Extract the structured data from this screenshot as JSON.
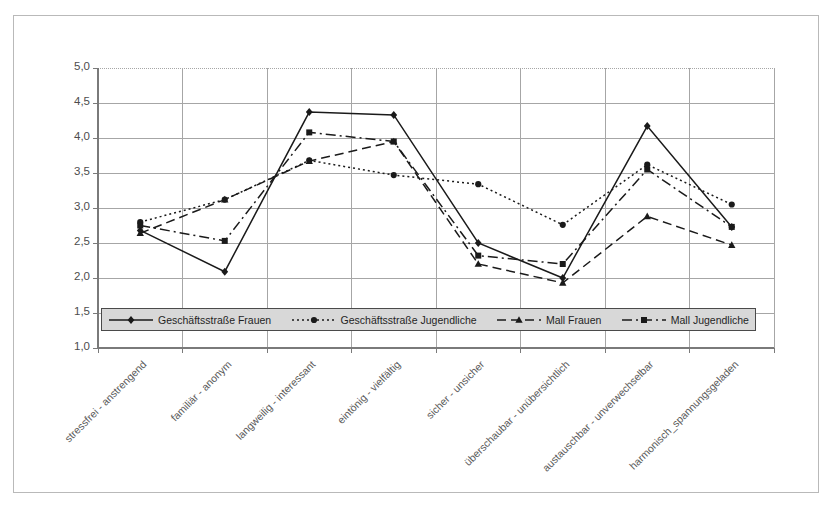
{
  "chart_data": {
    "type": "line",
    "title": "",
    "subtitle": "",
    "xlabel": "",
    "ylabel": "",
    "ylim": [
      1.0,
      5.0
    ],
    "y_tick_step": 0.5,
    "grid": true,
    "grid_axis": "y",
    "legend_position": "inside-bottom-left",
    "decimal_separator": ",",
    "y_tick_labels": [
      "1,0",
      "1,5",
      "2,0",
      "2,5",
      "3,0",
      "3,5",
      "4,0",
      "4,5",
      "5,0"
    ],
    "y_tick_values": [
      1.0,
      1.5,
      2.0,
      2.5,
      3.0,
      3.5,
      4.0,
      4.5,
      5.0
    ],
    "categories": [
      "stressfrei - anstrengend",
      "familiär - anonym",
      "langweilig - interessant",
      "eintönig - vielfältig",
      "sicher - unsicher",
      "überschaubar - unübersichtlich",
      "austauschbar - unverwechselbar",
      "harmonisch_spannungsgeladen"
    ],
    "series": [
      {
        "name": "Geschäftsstraße Frauen",
        "marker": "diamond",
        "line_style": "solid",
        "color": "#1a1a1a",
        "values": [
          2.68,
          2.09,
          4.37,
          4.33,
          2.5,
          2.0,
          4.17,
          2.73
        ]
      },
      {
        "name": "Geschäftsstraße Jugendliche",
        "marker": "circle",
        "line_style": "dotted",
        "color": "#1a1a1a",
        "values": [
          2.8,
          3.12,
          3.68,
          3.47,
          3.34,
          2.76,
          3.62,
          3.05
        ]
      },
      {
        "name": "Mall Frauen",
        "marker": "triangle",
        "line_style": "dashed",
        "color": "#1a1a1a",
        "values": [
          2.64,
          3.12,
          3.67,
          3.95,
          2.2,
          1.93,
          2.88,
          2.47
        ]
      },
      {
        "name": "Mall Jugendliche",
        "marker": "square",
        "line_style": "dashdot",
        "color": "#1a1a1a",
        "values": [
          2.75,
          2.53,
          4.08,
          3.95,
          2.32,
          2.2,
          3.55,
          2.73
        ]
      }
    ]
  },
  "colors": {
    "background": "#ffffff",
    "frame": "#b9b9b9",
    "gridline": "#a6a6a6",
    "axis": "#808080",
    "series": "#1a1a1a",
    "legend_fill": "#d8d8d8",
    "legend_border": "#4a4a4a",
    "tick_text": "#4d4d4d"
  }
}
